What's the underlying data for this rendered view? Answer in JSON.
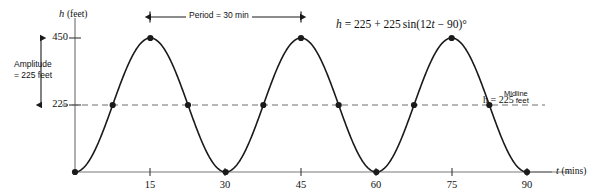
{
  "figure": {
    "name": "ferris-wheel-height-sine-graph",
    "background_color": "#ffffff",
    "ink_color": "#1a1a1a",
    "axis_color": "#7a7a7a",
    "curve_color": "#1a1a1a",
    "midline_color": "#6e6e6e"
  },
  "axes": {
    "y_axis_title": "h",
    "y_axis_unit": "(feet)",
    "x_axis_title": "t",
    "x_axis_unit": "(mins)",
    "y_ticks": [
      "450",
      "225"
    ],
    "x_ticks": [
      "15",
      "30",
      "45",
      "60",
      "75",
      "90"
    ]
  },
  "annotations": {
    "amplitude_line1": "Amplitude",
    "amplitude_line2": "= 225 feet",
    "period_label": "Period = 30 min",
    "equation": "h = 225 + 225 sin(12t − 90)°",
    "equation_parts": {
      "h": "h",
      "eq": "=",
      "midline_value": "225",
      "plus": "+",
      "amplitude_value": "225",
      "sin": "sin",
      "open": "(",
      "coefficient": "12",
      "t": "t",
      "minus": "−",
      "phase": "90",
      "close": ")",
      "degree": "°"
    },
    "midline_word": "Midline",
    "midline_equation": "h = 225",
    "midline_units": "feet"
  },
  "chart_data": {
    "type": "line",
    "title": "",
    "subtitle": "",
    "xlabel": "t (mins)",
    "ylabel": "h (feet)",
    "xlim": [
      0,
      96
    ],
    "ylim": [
      0,
      480
    ],
    "xticks": [
      15,
      30,
      45,
      60,
      75,
      90
    ],
    "yticks": [
      225,
      450
    ],
    "grid": false,
    "legend": null,
    "equation": "h = 225 + 225 sin(12t - 90)°",
    "parameters": {
      "midline": 225,
      "amplitude": 225,
      "period_minutes": 30,
      "angular_coefficient_deg_per_min": 12,
      "phase_shift_deg": -90,
      "maximum": 450,
      "minimum": 0
    },
    "series": [
      {
        "name": "h(t)",
        "x": [
          0,
          7.5,
          15,
          22.5,
          30,
          37.5,
          45,
          52.5,
          60,
          67.5,
          75,
          82.5,
          90
        ],
        "values": [
          0,
          225,
          450,
          225,
          0,
          225,
          450,
          225,
          0,
          225,
          450,
          225,
          0
        ],
        "marked_points": [
          {
            "t": 0,
            "h": 0,
            "kind": "minimum"
          },
          {
            "t": 7.5,
            "h": 225,
            "kind": "midline-crossing"
          },
          {
            "t": 15,
            "h": 450,
            "kind": "maximum"
          },
          {
            "t": 22.5,
            "h": 225,
            "kind": "midline-crossing"
          },
          {
            "t": 30,
            "h": 0,
            "kind": "minimum"
          },
          {
            "t": 37.5,
            "h": 225,
            "kind": "midline-crossing"
          },
          {
            "t": 45,
            "h": 450,
            "kind": "maximum"
          },
          {
            "t": 52.5,
            "h": 225,
            "kind": "midline-crossing"
          },
          {
            "t": 60,
            "h": 0,
            "kind": "minimum"
          },
          {
            "t": 67.5,
            "h": 225,
            "kind": "midline-crossing"
          },
          {
            "t": 75,
            "h": 450,
            "kind": "maximum"
          },
          {
            "t": 82.5,
            "h": 225,
            "kind": "midline-crossing"
          },
          {
            "t": 90,
            "h": 0,
            "kind": "minimum"
          }
        ]
      }
    ],
    "reference_lines": [
      {
        "name": "midline",
        "orientation": "horizontal",
        "value": 225,
        "style": "dashed",
        "label": "Midline h = 225 feet"
      }
    ],
    "measure_annotations": [
      {
        "name": "amplitude",
        "orientation": "vertical",
        "from": 225,
        "to": 450,
        "label": "Amplitude = 225 feet"
      },
      {
        "name": "period",
        "orientation": "horizontal",
        "from": 15,
        "to": 45,
        "label": "Period = 30 min"
      }
    ]
  }
}
